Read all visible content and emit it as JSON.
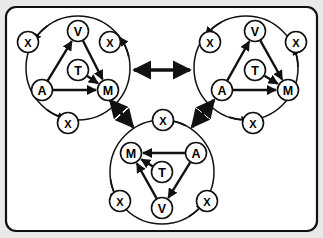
{
  "figure": {
    "background_color": "#e9e9e9",
    "panel_color": "#ffffff",
    "stroke_color": "#111111",
    "border": {
      "name": "rounded-panel-border",
      "x": 6,
      "y": 7,
      "width": 311,
      "height": 224,
      "radius": 10,
      "stroke_width": 2.2
    }
  },
  "diagram": {
    "type": "graph",
    "node_radius": 10.5,
    "cluster_radius": 52,
    "clusters": [
      {
        "id": "cluster-left",
        "name": "cluster-left",
        "cx": 78,
        "cy": 68,
        "orientation": "upright",
        "inner_nodes": [
          {
            "id": "V",
            "label": "V",
            "x": 78,
            "y": 31
          },
          {
            "id": "T",
            "label": "T",
            "x": 78,
            "y": 70
          },
          {
            "id": "A",
            "label": "A",
            "x": 42,
            "y": 90
          },
          {
            "id": "M",
            "label": "M",
            "x": 108,
            "y": 90
          }
        ],
        "outer_nodes": [
          {
            "id": "X1",
            "label": "X",
            "x": 28,
            "y": 42
          },
          {
            "id": "X2",
            "label": "X",
            "x": 110,
            "y": 42
          },
          {
            "id": "X3",
            "label": "X",
            "x": 68,
            "y": 123
          }
        ],
        "inner_edges": [
          {
            "from": "A",
            "to": "V",
            "kind": "arrow"
          },
          {
            "from": "V",
            "to": "M",
            "kind": "arrow"
          },
          {
            "from": "A",
            "to": "M",
            "kind": "arrow"
          },
          {
            "from": "T",
            "to": "M",
            "kind": "arrow"
          }
        ],
        "outer_edges": [
          {
            "from": "ring",
            "to": "X1",
            "kind": "arc-arrow"
          },
          {
            "from": "ring",
            "to": "X2",
            "kind": "arc-arrow"
          },
          {
            "from": "ring",
            "to": "X3",
            "kind": "arc-arrow"
          }
        ]
      },
      {
        "id": "cluster-right",
        "name": "cluster-right",
        "cx": 246,
        "cy": 68,
        "orientation": "upright",
        "inner_nodes": [
          {
            "id": "V",
            "label": "V",
            "x": 255,
            "y": 31
          },
          {
            "id": "T",
            "label": "T",
            "x": 255,
            "y": 70
          },
          {
            "id": "A",
            "label": "A",
            "x": 222,
            "y": 90
          },
          {
            "id": "M",
            "label": "M",
            "x": 288,
            "y": 90
          }
        ],
        "outer_nodes": [
          {
            "id": "X1",
            "label": "X",
            "x": 210,
            "y": 42
          },
          {
            "id": "X2",
            "label": "X",
            "x": 296,
            "y": 42
          },
          {
            "id": "X3",
            "label": "X",
            "x": 253,
            "y": 123
          }
        ],
        "inner_edges": [
          {
            "from": "A",
            "to": "V",
            "kind": "arrow"
          },
          {
            "from": "V",
            "to": "M",
            "kind": "arrow"
          },
          {
            "from": "A",
            "to": "M",
            "kind": "arrow"
          },
          {
            "from": "T",
            "to": "M",
            "kind": "arrow"
          }
        ],
        "outer_edges": [
          {
            "from": "ring",
            "to": "X1",
            "kind": "arc-arrow"
          },
          {
            "from": "ring",
            "to": "X2",
            "kind": "arc-arrow"
          },
          {
            "from": "ring",
            "to": "X3",
            "kind": "arc-arrow"
          }
        ]
      },
      {
        "id": "cluster-bottom",
        "name": "cluster-bottom",
        "cx": 162,
        "cy": 172,
        "orientation": "flipped",
        "inner_nodes": [
          {
            "id": "V",
            "label": "V",
            "x": 162,
            "y": 208
          },
          {
            "id": "T",
            "label": "T",
            "x": 162,
            "y": 172
          },
          {
            "id": "A",
            "label": "A",
            "x": 196,
            "y": 153
          },
          {
            "id": "M",
            "label": "M",
            "x": 131,
            "y": 153
          }
        ],
        "outer_nodes": [
          {
            "id": "X1",
            "label": "X",
            "x": 163,
            "y": 120
          },
          {
            "id": "X2",
            "label": "X",
            "x": 120,
            "y": 201
          },
          {
            "id": "X3",
            "label": "X",
            "x": 207,
            "y": 201
          }
        ],
        "inner_edges": [
          {
            "from": "A",
            "to": "M",
            "kind": "arrow"
          },
          {
            "from": "A",
            "to": "V",
            "kind": "arrow"
          },
          {
            "from": "V",
            "to": "M",
            "kind": "arrow"
          },
          {
            "from": "T",
            "to": "M",
            "kind": "arrow"
          }
        ],
        "outer_edges": [
          {
            "from": "ring",
            "to": "X1",
            "kind": "arc-arrow"
          },
          {
            "from": "ring",
            "to": "X2",
            "kind": "arc-arrow"
          },
          {
            "from": "ring",
            "to": "X3",
            "kind": "arc-arrow"
          }
        ]
      }
    ],
    "cluster_links": [
      {
        "id": "link-left-right",
        "name": "link-left-right",
        "from": "cluster-left",
        "to": "cluster-right",
        "x1": 134,
        "y1": 70,
        "x2": 190,
        "y2": 70,
        "double_headed": true,
        "stroke_width": 3.4
      },
      {
        "id": "link-left-bottom",
        "name": "link-left-bottom",
        "from": "cluster-left",
        "to": "cluster-bottom",
        "x1": 110,
        "y1": 100,
        "x2": 133,
        "y2": 127,
        "double_headed": true,
        "stroke_width": 3.4
      },
      {
        "id": "link-right-bottom",
        "name": "link-right-bottom",
        "from": "cluster-right",
        "to": "cluster-bottom",
        "x1": 214,
        "y1": 100,
        "x2": 192,
        "y2": 127,
        "double_headed": true,
        "stroke_width": 3.4
      }
    ],
    "node_letters": [
      "V",
      "T",
      "A",
      "M",
      "X"
    ]
  }
}
